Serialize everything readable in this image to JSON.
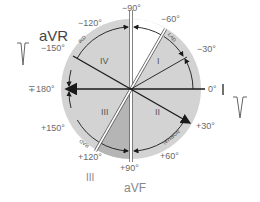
{
  "diagram": {
    "colors": {
      "circle_fill": "#d2d2d2",
      "inner_fill": "#cfcfcf",
      "white_sector": "#ffffff",
      "dark_sector": "#b8b8b8",
      "line": "#1a1a1a",
      "text": "#666666"
    },
    "angles": {
      "minus90": "−90°",
      "minus60": "−60°",
      "minus30": "−30°",
      "zero": "0°",
      "plus30": "+30°",
      "plus60": "+60°",
      "plus90": "+90°",
      "plus120": "+120°",
      "plus150": "+150°",
      "pm180": "∓180°",
      "minus150": "−150°",
      "minus120": "−120°"
    },
    "leads": {
      "aVR": "aVR",
      "I": "I",
      "aVF": "aVF",
      "III": "III"
    },
    "quadrants": {
      "q1": "I",
      "q2": "II",
      "q3": "III",
      "q4": "IV"
    },
    "arc_labels": {
      "ird": "IRD",
      "lad": "LAD",
      "rad": "RAD",
      "normal": "NORMAL"
    }
  }
}
